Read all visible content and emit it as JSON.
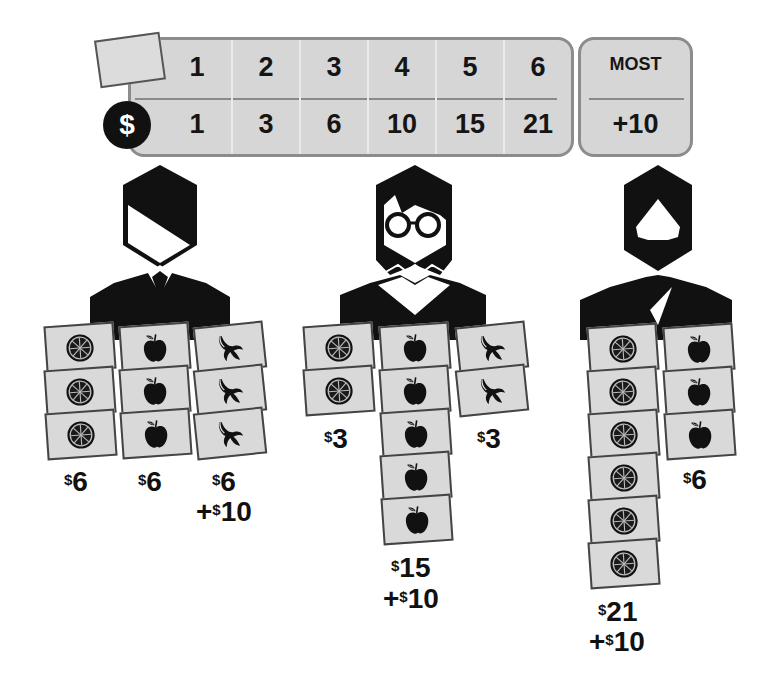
{
  "score_table": {
    "counts": [
      "1",
      "2",
      "3",
      "4",
      "5",
      "6"
    ],
    "values": [
      "1",
      "3",
      "6",
      "10",
      "15",
      "21"
    ],
    "currency_symbol": "$",
    "most": {
      "label": "MOST",
      "bonus": "+10"
    }
  },
  "players": [
    {
      "name": "businessman",
      "stacks": [
        {
          "fruit": "orange",
          "count": 3,
          "amount": "6"
        },
        {
          "fruit": "apple",
          "count": 3,
          "amount": "6"
        },
        {
          "fruit": "banana",
          "count": 3,
          "amount": "6",
          "bonus": "10"
        }
      ]
    },
    {
      "name": "glasses-person",
      "stacks": [
        {
          "fruit": "orange",
          "count": 2,
          "amount": "3"
        },
        {
          "fruit": "apple",
          "count": 5,
          "amount": "15",
          "bonus": "10"
        },
        {
          "fruit": "banana",
          "count": 2,
          "amount": "3"
        }
      ]
    },
    {
      "name": "bearded-man",
      "stacks": [
        {
          "fruit": "orange",
          "count": 6,
          "amount": "21",
          "bonus": "10"
        },
        {
          "fruit": "apple",
          "count": 3,
          "amount": "6"
        }
      ]
    }
  ],
  "labels": {
    "dollar": "$",
    "plus": "+",
    "p1_orange": "6",
    "p1_apple": "6",
    "p1_banana": "6",
    "p1_bonus": "10",
    "p2_orange": "3",
    "p2_apple": "15",
    "p2_banana": "3",
    "p2_bonus": "10",
    "p3_orange": "21",
    "p3_apple": "6",
    "p3_bonus": "10"
  },
  "colors": {
    "card": "#d9d9d9",
    "ink": "#111111",
    "table": "#d6d6d6",
    "border": "#8c8c8c"
  }
}
